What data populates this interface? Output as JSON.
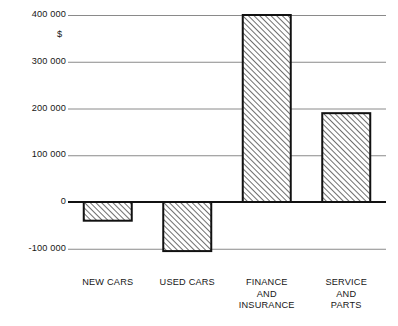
{
  "chart_data": {
    "type": "bar",
    "title": "",
    "subtitle": "",
    "xlabel": "",
    "ylabel": "$",
    "unit_label": "$",
    "categories": [
      "NEW CARS",
      "USED CARS",
      "FINANCE AND INSURANCE",
      "SERVICE AND PARTS"
    ],
    "category_lines": [
      [
        "NEW CARS"
      ],
      [
        "USED CARS"
      ],
      [
        "FINANCE",
        "AND",
        "INSURANCE"
      ],
      [
        "SERVICE",
        "AND",
        "PARTS"
      ]
    ],
    "values": [
      -40000,
      -105000,
      400000,
      190000
    ],
    "ylim": [
      -100000,
      400000
    ],
    "yticks": [
      400000,
      300000,
      200000,
      100000,
      0,
      -100000
    ],
    "ytick_labels": [
      "400 000",
      "300 000",
      "200 000",
      "100 000",
      "0",
      "-100 000"
    ],
    "grid": true,
    "grid_axis": "y",
    "legend": false,
    "legend_position": "none",
    "bar_fill": "diagonal-hatch",
    "bar_edge_color": "#111111",
    "grid_color": "#8a8a8a",
    "zero_line_color": "#111111",
    "background_color": "#ffffff"
  }
}
